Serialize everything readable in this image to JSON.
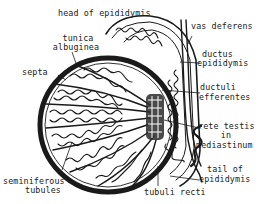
{
  "figure": {
    "line_color": "#1a1a1a",
    "background": "#ffffff"
  },
  "labels": {
    "head_of_epididymis": "head of epididymis",
    "vas_deferens": "vas deferens",
    "tunica_albuginea_1": "tunica",
    "tunica_albuginea_2": "albuginea",
    "septa": "septa",
    "ductus_epididymis_1": "ductus",
    "ductus_epididymis_2": "epididymis",
    "ductuli_efferentes_1": "ductuli",
    "ductuli_efferentes_2": "efferentes",
    "rete_testis_1": "rete testis",
    "rete_testis_2": "in",
    "rete_testis_3": "mediastinum",
    "tail_of_epididymis_1": "tail of",
    "tail_of_epididymis_2": "epididymis",
    "seminiferous_tubules_1": "seminiferous",
    "seminiferous_tubules_2": "tubules",
    "tubuli_recti": "tubuli recti"
  }
}
